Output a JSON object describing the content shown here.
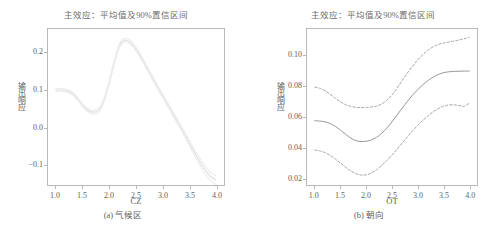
{
  "figure": {
    "panels": [
      {
        "id": "a",
        "title": "主效应：平均值及90%置信区间",
        "xlabel": "CZ",
        "ylabel": "输出响应",
        "caption": "(a) 气候区",
        "xticks": [
          "1.0",
          "1.5",
          "2.0",
          "2.5",
          "3.0",
          "3.5",
          "4.0"
        ],
        "yticks": [
          "0.2",
          "0.1",
          "0.0",
          "-0.1"
        ]
      },
      {
        "id": "b",
        "title": "主效应：平均值及90%置信区间",
        "xlabel": "OT",
        "ylabel": "输出响应",
        "caption": "(b) 朝向",
        "xticks": [
          "1.0",
          "1.5",
          "2.0",
          "2.5",
          "3.0",
          "3.5",
          "4.0"
        ],
        "yticks": [
          "0.10",
          "0.08",
          "0.06",
          "0.04",
          "0.02"
        ]
      }
    ]
  },
  "colors": {
    "frame": "#b9b9b9",
    "tick_text": "#5e5e5e",
    "title_text": "#6b6b6b",
    "mean_line_a": "#e3e3e3",
    "ci_line_a": "#ececec",
    "mean_line_b": "#8a8a8a",
    "ci_line_b": "#9a9a9a"
  },
  "chart_data": [
    {
      "type": "line",
      "panel": "a",
      "title": "主效应：平均值及90%置信区间",
      "xlabel": "CZ",
      "ylabel": "输出响应",
      "caption": "(a) 气候区",
      "xlim": [
        0.85,
        4.15
      ],
      "ylim": [
        -0.155,
        0.265
      ],
      "xticks": [
        1.0,
        1.5,
        2.0,
        2.5,
        3.0,
        3.5,
        4.0
      ],
      "yticks": [
        0.2,
        0.1,
        0.0,
        -0.1
      ],
      "grid": false,
      "legend": "none",
      "x": [
        1.0,
        1.1,
        1.2,
        1.3,
        1.4,
        1.5,
        1.6,
        1.7,
        1.8,
        1.9,
        2.0,
        2.1,
        2.2,
        2.3,
        2.4,
        2.5,
        2.6,
        2.7,
        2.8,
        2.9,
        3.0,
        3.1,
        3.2,
        3.3,
        3.4,
        3.5,
        3.6,
        3.7,
        3.8,
        3.9,
        4.0
      ],
      "series": [
        {
          "name": "平均值",
          "style": "solid",
          "values": [
            0.1,
            0.101,
            0.099,
            0.092,
            0.078,
            0.06,
            0.046,
            0.041,
            0.046,
            0.074,
            0.122,
            0.18,
            0.223,
            0.235,
            0.228,
            0.211,
            0.188,
            0.162,
            0.136,
            0.11,
            0.085,
            0.06,
            0.035,
            0.01,
            -0.015,
            -0.042,
            -0.068,
            -0.093,
            -0.115,
            -0.132,
            -0.142
          ]
        },
        {
          "name": "90%置信上限",
          "style": "dashed",
          "values": [
            0.104,
            0.105,
            0.103,
            0.096,
            0.082,
            0.064,
            0.051,
            0.046,
            0.051,
            0.079,
            0.127,
            0.184,
            0.228,
            0.24,
            0.233,
            0.216,
            0.193,
            0.167,
            0.141,
            0.115,
            0.09,
            0.065,
            0.041,
            0.016,
            -0.009,
            -0.035,
            -0.06,
            -0.084,
            -0.105,
            -0.121,
            -0.13
          ]
        },
        {
          "name": "90%置信下限",
          "style": "dashed",
          "values": [
            0.096,
            0.097,
            0.095,
            0.088,
            0.074,
            0.056,
            0.042,
            0.036,
            0.041,
            0.069,
            0.117,
            0.176,
            0.219,
            0.23,
            0.223,
            0.206,
            0.183,
            0.157,
            0.131,
            0.105,
            0.08,
            0.055,
            0.029,
            0.004,
            -0.021,
            -0.049,
            -0.076,
            -0.102,
            -0.125,
            -0.143,
            -0.154
          ]
        }
      ]
    },
    {
      "type": "line",
      "panel": "b",
      "title": "主效应：平均值及90%置信区间",
      "xlabel": "OT",
      "ylabel": "输出响应",
      "caption": "(b) 朝向",
      "xlim": [
        0.85,
        4.15
      ],
      "ylim": [
        0.0155,
        0.1175
      ],
      "xticks": [
        1.0,
        1.5,
        2.0,
        2.5,
        3.0,
        3.5,
        4.0
      ],
      "yticks": [
        0.1,
        0.08,
        0.06,
        0.04,
        0.02
      ],
      "grid": false,
      "legend": "none",
      "x": [
        1.0,
        1.1,
        1.2,
        1.3,
        1.4,
        1.5,
        1.6,
        1.7,
        1.8,
        1.9,
        2.0,
        2.1,
        2.2,
        2.3,
        2.4,
        2.5,
        2.6,
        2.7,
        2.8,
        2.9,
        3.0,
        3.1,
        3.2,
        3.3,
        3.4,
        3.5,
        3.6,
        3.7,
        3.8,
        3.9,
        4.0
      ],
      "series": [
        {
          "name": "平均值",
          "style": "solid",
          "values": [
            0.0575,
            0.0573,
            0.0568,
            0.0557,
            0.0538,
            0.0514,
            0.0487,
            0.0462,
            0.0445,
            0.0439,
            0.0441,
            0.045,
            0.0467,
            0.0493,
            0.0527,
            0.0568,
            0.0613,
            0.0659,
            0.0703,
            0.0743,
            0.0779,
            0.0811,
            0.0839,
            0.0861,
            0.0878,
            0.0889,
            0.0895,
            0.0898,
            0.0899,
            0.09,
            0.09
          ]
        },
        {
          "name": "90%置信上限",
          "style": "dashed",
          "values": [
            0.0795,
            0.0787,
            0.0771,
            0.0748,
            0.0722,
            0.0699,
            0.068,
            0.0669,
            0.0663,
            0.0661,
            0.0662,
            0.0665,
            0.0671,
            0.0685,
            0.0709,
            0.0744,
            0.0789,
            0.0839,
            0.0888,
            0.0933,
            0.0973,
            0.1008,
            0.1037,
            0.1059,
            0.1074,
            0.1083,
            0.109,
            0.1096,
            0.1103,
            0.1111,
            0.112
          ]
        },
        {
          "name": "90%置信下限",
          "style": "dashed",
          "values": [
            0.0383,
            0.0378,
            0.0367,
            0.0349,
            0.0325,
            0.0298,
            0.0271,
            0.0247,
            0.0229,
            0.022,
            0.0222,
            0.0234,
            0.0255,
            0.0283,
            0.0315,
            0.0351,
            0.039,
            0.043,
            0.047,
            0.0509,
            0.0545,
            0.0578,
            0.0608,
            0.0634,
            0.0655,
            0.067,
            0.0678,
            0.0679,
            0.0675,
            0.067,
            0.069
          ]
        }
      ]
    }
  ]
}
